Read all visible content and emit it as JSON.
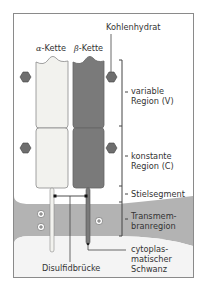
{
  "diagram": {
    "labels": {
      "carbohydrate": "Kohlenhydrat",
      "alpha_symbol": "α",
      "alpha_suffix": "-Kette",
      "beta_symbol": "β",
      "beta_suffix": "-Kette",
      "variable_line1": "variable",
      "variable_line2": "Region (V)",
      "constant_line1": "konstante",
      "constant_line2": "Region (C)",
      "stalk": "Stielsegment",
      "transmembrane_line1": "Transmem-",
      "transmembrane_line2": "branregion",
      "cytoplasmic_line1": "cytoplas-",
      "cytoplasmic_line2": "matischer",
      "cytoplasmic_line3": "Schwanz",
      "disulfide": "Disulfidbrücke"
    },
    "charges": [
      "+",
      "+",
      "+"
    ],
    "colors": {
      "alpha_chain": "#f2f2ee",
      "beta_chain": "#7a7a7a",
      "carbohydrate": "#6e6e6e",
      "membrane": "#b3b3b3",
      "cytoplasm": "#f4f4f4",
      "border": "#8a8a8a",
      "text": "#333333"
    }
  }
}
